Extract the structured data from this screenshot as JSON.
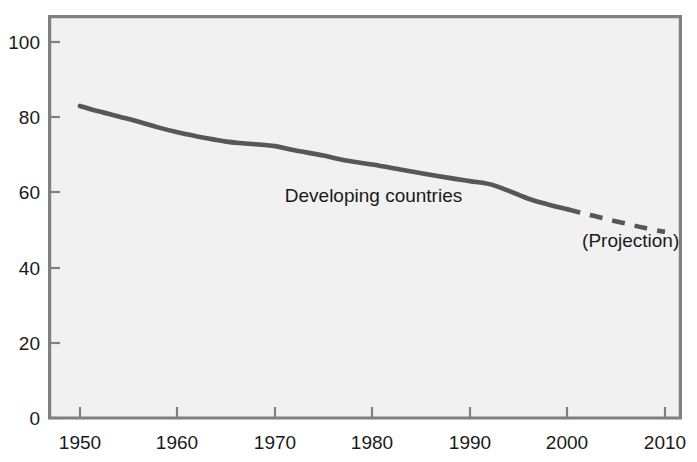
{
  "chart_data": {
    "type": "line",
    "title": "",
    "subtitle": "",
    "xlabel": "",
    "ylabel": "",
    "xlim": [
      1946,
      2014
    ],
    "ylim": [
      0,
      107
    ],
    "grid": false,
    "legend_position": "inline-annotation",
    "x_ticks": [
      1950,
      1960,
      1970,
      1980,
      1990,
      2000,
      2010
    ],
    "x_tick_labels": [
      "1950",
      "1960",
      "1970",
      "1980",
      "1990",
      "2000",
      "2010"
    ],
    "y_ticks": [
      0,
      20,
      40,
      60,
      80,
      100
    ],
    "y_tick_labels": [
      "0",
      "20",
      "40",
      "60",
      "80",
      "100"
    ],
    "annotations": [
      {
        "text": "Developing countries",
        "x": 1971,
        "y": 57.5
      },
      {
        "text": "(Projection)",
        "x": 2001.5,
        "y": 45.5
      }
    ],
    "series": [
      {
        "name": "Developing countries",
        "style": "solid",
        "color": "#575757",
        "x": [
          1950,
          1952,
          1955,
          1958,
          1960,
          1963,
          1965,
          1967,
          1970,
          1972,
          1975,
          1977,
          1980,
          1983,
          1985,
          1988,
          1990,
          1992,
          1994,
          1996,
          1998,
          2000
        ],
        "values": [
          83.0,
          81.5,
          79.5,
          77.3,
          76.0,
          74.4,
          73.5,
          73.0,
          72.3,
          71.2,
          69.8,
          68.6,
          67.4,
          66.0,
          65.1,
          63.8,
          63.0,
          62.2,
          60.4,
          58.3,
          56.8,
          55.5
        ]
      },
      {
        "name": "Developing countries (Projection)",
        "style": "dashed",
        "color": "#575757",
        "x": [
          2000,
          2002,
          2004,
          2006,
          2008,
          2010
        ],
        "values": [
          55.5,
          54.2,
          52.9,
          51.7,
          50.5,
          49.5
        ]
      }
    ]
  },
  "colors": {
    "plot_background": "#f1f1f1",
    "frame": "#808080",
    "line": "#575757",
    "text": "#1a1a1a",
    "page_background": "#ffffff"
  }
}
